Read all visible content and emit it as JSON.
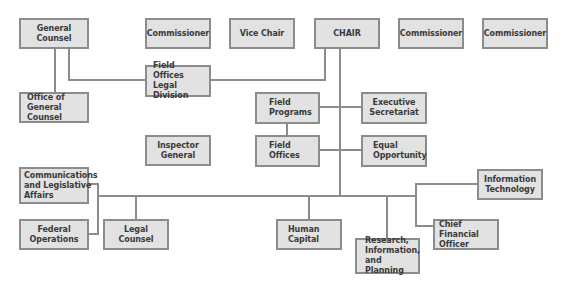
{
  "diagram": {
    "type": "org-chart",
    "top_row": {
      "general_counsel": "General Counsel",
      "commissioner_1": "Commissioner",
      "vice_chair": "Vice Chair",
      "chair": "CHAIR",
      "commissioner_2": "Commissioner",
      "commissioner_3": "Commissioner"
    },
    "legal": {
      "field_offices_legal_division": "Field Offices\nLegal Division",
      "office_of_general_counsel": "Office of\nGeneral Counsel"
    },
    "middle": {
      "field_programs": "Field\nPrograms",
      "executive_secretariat": "Executive\nSecretariat",
      "inspector_general": "Inspector\nGeneral",
      "field_offices": "Field\nOffices",
      "equal_opportunity": "Equal\nOpportunity"
    },
    "bottom": {
      "communications_legislative_affairs": "Communications\nand Legislative\nAffairs",
      "federal_operations": "Federal\nOperations",
      "legal_counsel": "Legal Counsel",
      "human_capital": "Human\nCapital",
      "research_information_planning": "Research,\nInformation,\nand Planning",
      "chief_financial_officer": "Chief\nFinancial Officer",
      "information_technology": "Information\nTechnology"
    },
    "colors": {
      "box_fill": "#e2e2e2",
      "box_border": "#8c8c8c",
      "connector": "#8c8c8c",
      "text": "#3a3a3a"
    }
  }
}
